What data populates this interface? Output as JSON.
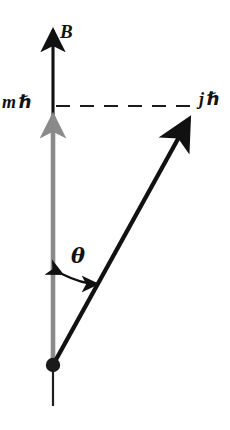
{
  "figure": {
    "background_color": "#ffffff"
  },
  "labels": {
    "field_axis": "B",
    "projection_symbol": "m",
    "projection_unit": "ℏ",
    "total_symbol": "j",
    "total_unit": "ℏ",
    "angle": "θ"
  },
  "colors": {
    "ink": "#111111",
    "gray_vector": "#8a8a8a",
    "dashed_line": "#1a1a1a",
    "background": "#ffffff"
  },
  "geometry": {
    "origin": {
      "x": 53,
      "y": 365
    },
    "field_arrow": {
      "x1": 53,
      "y1": 365,
      "x2": 53,
      "y2": 24
    },
    "projection_arrow": {
      "x1": 53,
      "y1": 365,
      "x2": 53,
      "y2": 107
    },
    "total_arrow": {
      "x1": 53,
      "y1": 365,
      "x2": 196,
      "y2": 107
    },
    "dashed_line": {
      "x1": 55,
      "y1": 106,
      "x2": 194,
      "y2": 106,
      "dash_count": 6
    },
    "angle_arc": {
      "start_x": 57,
      "start_y": 276,
      "end_x": 101,
      "end_y": 288,
      "double_headed": true
    },
    "axis_tail": {
      "x1": 53,
      "y1": 372,
      "x2": 53,
      "y2": 406
    },
    "origin_dot_radius": 7
  },
  "elements": {
    "field_arrow_name": "magnetic-field-vector",
    "projection_arrow_name": "m-hbar-projection-vector",
    "total_arrow_name": "j-hbar-total-vector",
    "dashed_line_name": "projection-dashed-line",
    "angle_arc_name": "theta-angle-arc",
    "origin_name": "origin-dot"
  }
}
